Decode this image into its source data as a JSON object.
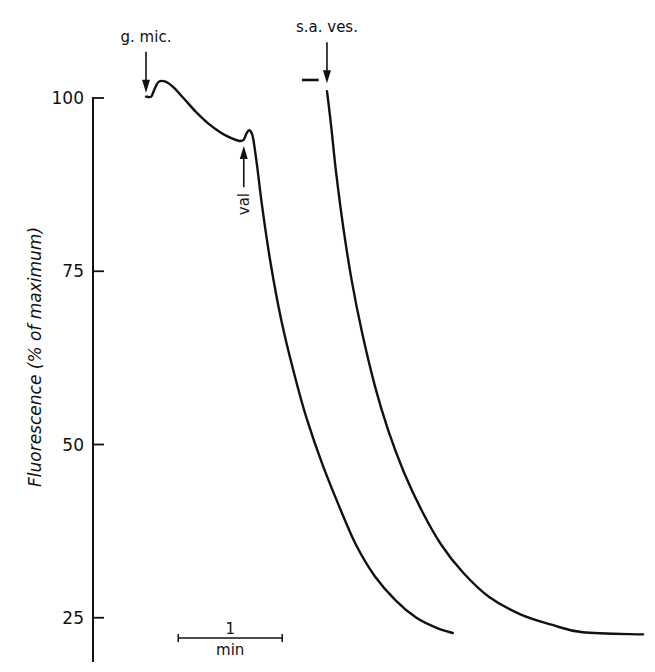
{
  "chart_data": {
    "type": "line",
    "title": "",
    "xlabel": "",
    "ylabel": "Fluorescence (% of maximum)",
    "ylim": [
      20,
      105
    ],
    "yticks": [
      {
        "value": 100,
        "label": "100"
      },
      {
        "value": 75,
        "label": "75"
      },
      {
        "value": 50,
        "label": "50"
      },
      {
        "value": 25,
        "label": "25"
      }
    ],
    "x_units": "min",
    "xlim": [
      -0.5,
      4.8
    ],
    "scale_bar": {
      "length": 1,
      "value_label": "1",
      "unit_label": "min",
      "start_x": 0.31
    },
    "grid": false,
    "legend": "none",
    "series": [
      {
        "name": "g. mic. + val",
        "points": [
          [
            0.0,
            100.2
          ],
          [
            0.05,
            100.2
          ],
          [
            0.08,
            101.2
          ],
          [
            0.12,
            102.3
          ],
          [
            0.18,
            102.4
          ],
          [
            0.26,
            101.6
          ],
          [
            0.36,
            100.0
          ],
          [
            0.48,
            98.0
          ],
          [
            0.6,
            96.3
          ],
          [
            0.72,
            95.0
          ],
          [
            0.82,
            94.2
          ],
          [
            0.9,
            93.8
          ],
          [
            0.94,
            94.0
          ],
          [
            0.97,
            95.0
          ],
          [
            1.0,
            95.3
          ],
          [
            1.03,
            94.2
          ],
          [
            1.07,
            90.0
          ],
          [
            1.12,
            84.0
          ],
          [
            1.2,
            76.0
          ],
          [
            1.3,
            68.0
          ],
          [
            1.42,
            60.5
          ],
          [
            1.55,
            53.5
          ],
          [
            1.7,
            47.0
          ],
          [
            1.86,
            41.0
          ],
          [
            2.02,
            35.5
          ],
          [
            2.2,
            31.0
          ],
          [
            2.4,
            27.5
          ],
          [
            2.6,
            25.0
          ],
          [
            2.8,
            23.5
          ],
          [
            2.95,
            22.8
          ]
        ]
      },
      {
        "name": "s.a. ves.",
        "pre_segment": [
          [
            1.5,
            102.6
          ],
          [
            1.66,
            102.6
          ]
        ],
        "points": [
          [
            1.74,
            101.0
          ],
          [
            1.78,
            96.0
          ],
          [
            1.83,
            89.0
          ],
          [
            1.9,
            81.0
          ],
          [
            1.98,
            73.5
          ],
          [
            2.08,
            66.0
          ],
          [
            2.2,
            58.5
          ],
          [
            2.33,
            52.0
          ],
          [
            2.48,
            46.0
          ],
          [
            2.65,
            40.5
          ],
          [
            2.84,
            35.5
          ],
          [
            3.05,
            31.5
          ],
          [
            3.3,
            28.0
          ],
          [
            3.6,
            25.5
          ],
          [
            3.9,
            24.0
          ],
          [
            4.2,
            22.9
          ],
          [
            4.78,
            22.6
          ]
        ]
      }
    ],
    "annotations": [
      {
        "id": "g-mic",
        "text": "g. mic.",
        "x": 0.0,
        "y": 100.6,
        "direction": "down"
      },
      {
        "id": "sa-ves",
        "text": "s.a. ves.",
        "x": 1.74,
        "y": 102.0,
        "direction": "down"
      },
      {
        "id": "val",
        "text": "val",
        "x": 0.94,
        "y": 93.2,
        "direction": "up",
        "rotated": true
      }
    ]
  }
}
